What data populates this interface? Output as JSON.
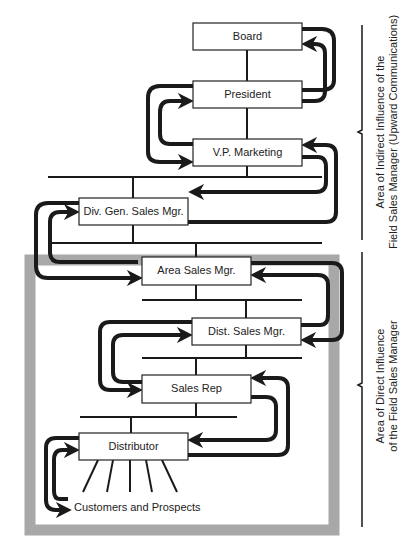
{
  "diagram": {
    "nodes": [
      {
        "id": "board",
        "label": "Board"
      },
      {
        "id": "president",
        "label": "President"
      },
      {
        "id": "vp_marketing",
        "label": "V.P. Marketing"
      },
      {
        "id": "div_gen_sales_mgr",
        "label": "Div. Gen. Sales Mgr."
      },
      {
        "id": "area_sales_mgr",
        "label": "Area Sales Mgr."
      },
      {
        "id": "dist_sales_mgr",
        "label": "Dist. Sales Mgr."
      },
      {
        "id": "sales_rep",
        "label": "Sales Rep"
      },
      {
        "id": "distributor",
        "label": "Distributor"
      }
    ],
    "customers_label": "Customers and Prospects",
    "brackets": {
      "indirect": {
        "line1": "Area of Indirect Influence of the",
        "line2": "Field Sales Manager (Upward Communications)"
      },
      "direct": {
        "line1": "Area of Direct Influence",
        "line2": "of the Field Sales Manager"
      }
    },
    "colors": {
      "line": "#1a1a1a",
      "frame": "#a8a8a8",
      "box_fill": "#ffffff"
    }
  }
}
